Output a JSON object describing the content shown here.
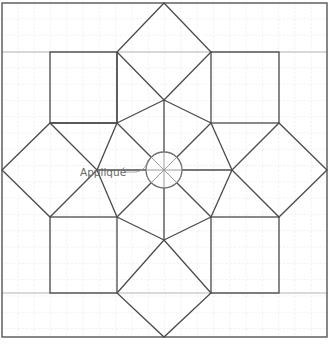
{
  "diagram": {
    "type": "quilt-block-pattern",
    "width": 328,
    "height": 353,
    "colors": {
      "background": "#ffffff",
      "grid": "#d6d6d6",
      "outline": "#4a4a4a",
      "guide_line": "#b0b0b0",
      "applique_circle": "#7a7a7a",
      "label_text": "#6a6a6a",
      "leader_line": "#9a9a9a"
    },
    "grid": {
      "spacing": 16.3,
      "style": "dashed"
    },
    "border": {
      "x1": 2,
      "y1": 3,
      "x2": 327,
      "y2": 337
    },
    "guide_lines_y": [
      52,
      293
    ],
    "center": {
      "x": 164,
      "y": 170
    },
    "applique": {
      "label": "Appliqué",
      "label_x": 80,
      "label_y": 178,
      "circle_radius": 18
    },
    "diamonds": [
      {
        "name": "top",
        "points": "164,3 211,52 164,100 117,52"
      },
      {
        "name": "bottom",
        "points": "164,240 211,293 164,337 117,293"
      },
      {
        "name": "left",
        "points": "2,170 50,123 97,170 50,217"
      },
      {
        "name": "right",
        "points": "232,170 279,123 327,170 279,217"
      }
    ],
    "squares": [
      {
        "name": "top-left",
        "x": 50,
        "y": 52,
        "w": 67,
        "h": 71
      },
      {
        "name": "top-right",
        "x": 211,
        "y": 52,
        "w": 68,
        "h": 71
      },
      {
        "name": "bottom-left",
        "x": 50,
        "y": 217,
        "w": 67,
        "h": 76
      },
      {
        "name": "bottom-right",
        "x": 211,
        "y": 217,
        "w": 68,
        "h": 76
      }
    ]
  }
}
